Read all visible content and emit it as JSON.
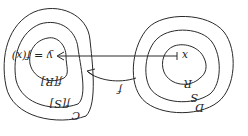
{
  "diagram": {
    "orientation": "rotated-180",
    "domain_set": {
      "outer": "D",
      "middle": "S",
      "inner": "R",
      "point": "x"
    },
    "codomain_set": {
      "outer": "C",
      "middle": "f[S]",
      "inner": "f[R]",
      "point": "y = f(x)"
    },
    "mapping_label": "f",
    "stroke_color": "#2a2a2a",
    "background": "#ffffff"
  }
}
